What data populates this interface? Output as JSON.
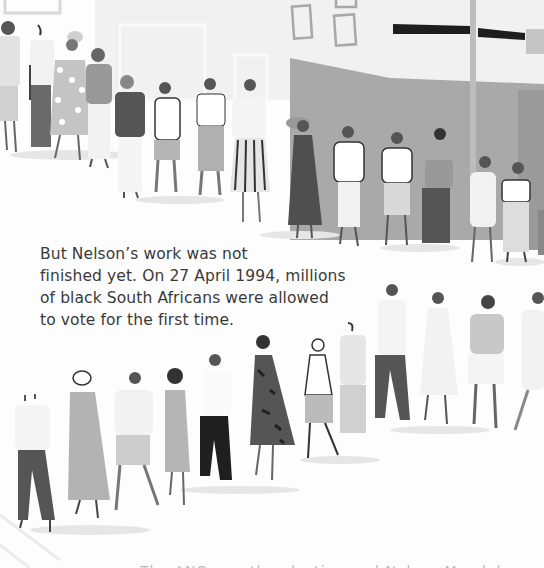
{
  "page": {
    "type": "illustrated-book-page",
    "palette": {
      "background": "#fdfdfd",
      "building_gray": "#a9a9a9",
      "building_light": "#ececec",
      "sign_dark": "#1e1e1e",
      "figure_dark": "#4a4a4a",
      "figure_mid": "#8c8c8c",
      "figure_light": "#cfcfcf",
      "text": "#3a3a3a"
    }
  },
  "story": {
    "lines": [
      "But Nelson’s work was not",
      "finished yet. On 27 April 1994, millions",
      "of black South Africans were allowed",
      "to vote for the first time."
    ]
  },
  "illustration": {
    "description": "People queueing in two lines outside a building to vote",
    "top_queue_count": 18,
    "bottom_queue_count": 14
  },
  "footer": {
    "partial_text": "The ANC won the election and Nelson Mandela"
  }
}
